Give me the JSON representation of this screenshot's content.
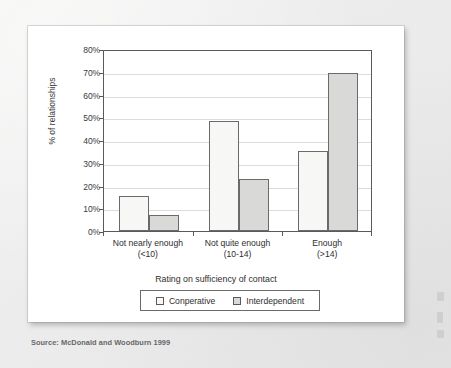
{
  "chart_data": {
    "type": "bar",
    "title": "",
    "xlabel": "Rating on sufficiency of contact",
    "ylabel": "% of relationships",
    "categories": [
      {
        "line1": "Not nearly enough",
        "line2": "(<10)"
      },
      {
        "line1": "Not quite enough",
        "line2": "(10-14)"
      },
      {
        "line1": "Enough",
        "line2": "(>14)"
      }
    ],
    "series": [
      {
        "name": "Conperative",
        "values": [
          15.5,
          48.5,
          35
        ],
        "color": "#f7f7f5"
      },
      {
        "name": "Interdependent",
        "values": [
          7,
          23,
          69.5
        ],
        "color": "#d9d9d7"
      }
    ],
    "ylim": [
      0,
      80
    ],
    "yticks": [
      "0%",
      "10%",
      "20%",
      "30%",
      "40%",
      "50%",
      "60%",
      "70%",
      "80%"
    ],
    "ytick_values": [
      0,
      10,
      20,
      30,
      40,
      50,
      60,
      70,
      80
    ],
    "grid": true,
    "legend_position": "bottom"
  },
  "caption": {
    "source": "Source: McDonald and Woodburn  1999"
  }
}
